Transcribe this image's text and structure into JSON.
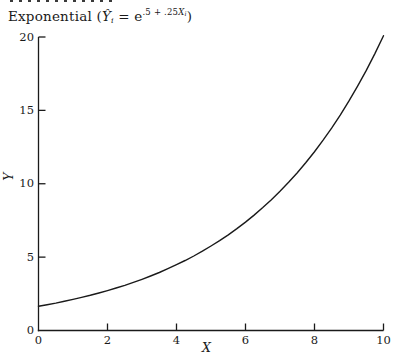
{
  "figure": {
    "title": {
      "prefix": "Exponential (",
      "y_hat": "Ŷ",
      "y_sub": "i",
      "equals": " = e",
      "exponent_coeffs": ".5 + .25",
      "exponent_var": "X",
      "exponent_sub": "i",
      "close_paren": ")"
    },
    "x_axis_label": "X",
    "y_axis_label": "Y"
  },
  "chart_data": {
    "type": "line",
    "xlabel": "X",
    "ylabel": "Y",
    "xlim": [
      0,
      10
    ],
    "ylim": [
      0,
      20
    ],
    "x_ticks": [
      0,
      2,
      4,
      6,
      8,
      10
    ],
    "y_ticks": [
      0,
      5,
      10,
      15,
      20
    ],
    "grid": false,
    "line_color": "#1a1a1a",
    "series": [
      {
        "name": "Y-hat = e^(0.5 + 0.25X)",
        "points": [
          [
            0,
            1.649
          ],
          [
            0.25,
            1.755
          ],
          [
            0.5,
            1.868
          ],
          [
            0.75,
            1.989
          ],
          [
            1,
            2.117
          ],
          [
            1.25,
            2.254
          ],
          [
            1.5,
            2.399
          ],
          [
            1.75,
            2.554
          ],
          [
            2,
            2.718
          ],
          [
            2.25,
            2.894
          ],
          [
            2.5,
            3.08
          ],
          [
            2.75,
            3.279
          ],
          [
            3,
            3.49
          ],
          [
            3.25,
            3.715
          ],
          [
            3.5,
            3.955
          ],
          [
            3.75,
            4.21
          ],
          [
            4,
            4.482
          ],
          [
            4.25,
            4.771
          ],
          [
            4.5,
            5.078
          ],
          [
            4.75,
            5.406
          ],
          [
            5,
            5.755
          ],
          [
            5.25,
            6.126
          ],
          [
            5.5,
            6.521
          ],
          [
            5.75,
            6.941
          ],
          [
            6,
            7.389
          ],
          [
            6.25,
            7.866
          ],
          [
            6.5,
            8.373
          ],
          [
            6.75,
            8.913
          ],
          [
            7,
            9.488
          ],
          [
            7.25,
            10.1
          ],
          [
            7.5,
            10.751
          ],
          [
            7.75,
            11.445
          ],
          [
            8,
            12.182
          ],
          [
            8.25,
            12.968
          ],
          [
            8.5,
            13.805
          ],
          [
            8.75,
            14.695
          ],
          [
            9,
            15.643
          ],
          [
            9.25,
            16.651
          ],
          [
            9.5,
            17.725
          ],
          [
            9.75,
            18.868
          ],
          [
            10,
            20.086
          ]
        ]
      }
    ]
  }
}
